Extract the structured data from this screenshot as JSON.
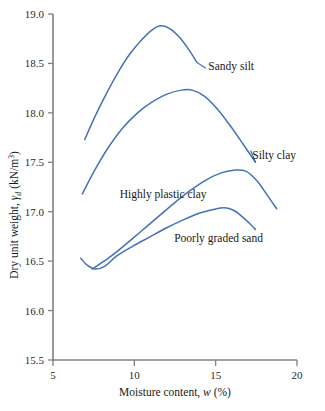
{
  "chart_data": {
    "type": "line",
    "title": "",
    "xlabel": "Moisture content, w (%)",
    "ylabel": "Dry unit weight, γd (kN/m³)",
    "xlim": [
      5,
      20
    ],
    "ylim": [
      15.5,
      19.0
    ],
    "xticks": [
      "5",
      "10",
      "15",
      "20"
    ],
    "xtick_values": [
      5,
      10,
      15,
      20
    ],
    "yticks": [
      "15.5",
      "16.0",
      "16.5",
      "17.0",
      "17.5",
      "18.0",
      "18.5",
      "19.0"
    ],
    "ytick_values": [
      15.5,
      16.0,
      16.5,
      17.0,
      17.5,
      18.0,
      18.5,
      19.0
    ],
    "grid": false,
    "legend": "inline-labels",
    "line_color": "#4472b8",
    "axis_color": "#808080",
    "series": [
      {
        "name": "Sandy silt",
        "label": "Sandy silt",
        "label_x": 14.55,
        "label_y": 18.47,
        "points": [
          [
            6.95,
            17.73
          ],
          [
            7.6,
            17.97
          ],
          [
            8.3,
            18.2
          ],
          [
            9.0,
            18.41
          ],
          [
            9.7,
            18.59
          ],
          [
            10.4,
            18.73
          ],
          [
            11.1,
            18.84
          ],
          [
            11.65,
            18.88
          ],
          [
            12.2,
            18.85
          ],
          [
            12.8,
            18.76
          ],
          [
            13.35,
            18.64
          ],
          [
            13.85,
            18.51
          ]
        ]
      },
      {
        "name": "Silty clay",
        "label": "Silty clay",
        "label_x": 17.25,
        "label_y": 17.57,
        "points": [
          [
            6.8,
            17.18
          ],
          [
            7.6,
            17.43
          ],
          [
            8.4,
            17.65
          ],
          [
            9.3,
            17.85
          ],
          [
            10.2,
            18.0
          ],
          [
            11.1,
            18.11
          ],
          [
            12.0,
            18.19
          ],
          [
            12.9,
            18.23
          ],
          [
            13.55,
            18.23
          ],
          [
            14.3,
            18.17
          ],
          [
            15.1,
            18.04
          ],
          [
            15.9,
            17.87
          ],
          [
            16.7,
            17.68
          ],
          [
            17.45,
            17.5
          ]
        ]
      },
      {
        "name": "Highly plastic clay",
        "label": "Highly plastic clay",
        "label_x": 9.1,
        "label_y": 17.18,
        "points": [
          [
            7.4,
            16.42
          ],
          [
            8.4,
            16.53
          ],
          [
            9.4,
            16.66
          ],
          [
            10.4,
            16.8
          ],
          [
            11.4,
            16.94
          ],
          [
            12.4,
            17.08
          ],
          [
            13.4,
            17.21
          ],
          [
            14.4,
            17.32
          ],
          [
            15.3,
            17.39
          ],
          [
            16.1,
            17.42
          ],
          [
            16.85,
            17.41
          ],
          [
            17.55,
            17.31
          ],
          [
            18.2,
            17.16
          ],
          [
            18.75,
            17.03
          ]
        ]
      },
      {
        "name": "Poorly graded sand",
        "label": "Poorly graded sand",
        "label_x": 12.45,
        "label_y": 16.73,
        "points": [
          [
            6.7,
            16.53
          ],
          [
            7.1,
            16.46
          ],
          [
            7.6,
            16.42
          ],
          [
            8.2,
            16.45
          ],
          [
            8.9,
            16.55
          ],
          [
            9.9,
            16.65
          ],
          [
            10.9,
            16.74
          ],
          [
            11.9,
            16.83
          ],
          [
            12.9,
            16.91
          ],
          [
            13.9,
            16.98
          ],
          [
            14.8,
            17.02
          ],
          [
            15.55,
            17.04
          ],
          [
            16.15,
            17.01
          ],
          [
            16.7,
            16.94
          ],
          [
            17.15,
            16.87
          ],
          [
            17.45,
            16.82
          ]
        ]
      }
    ],
    "leader_lines": [
      {
        "name": "sandy-silt-leader",
        "from": [
          13.85,
          18.51
        ],
        "to": [
          14.4,
          18.45
        ]
      },
      {
        "name": "silty-clay-leader",
        "from": [
          17.45,
          17.5
        ],
        "to": [
          17.15,
          17.62
        ]
      }
    ]
  }
}
